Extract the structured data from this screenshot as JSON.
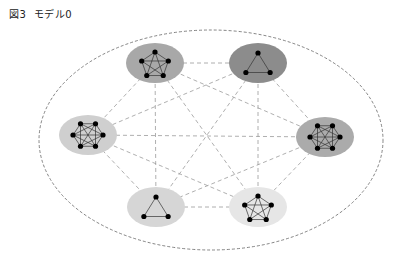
{
  "figure": {
    "title": "図3  モデル0"
  },
  "diagram": {
    "outer_boundary": {
      "cx": 211,
      "cy": 140,
      "rx": 172,
      "ry": 110,
      "style": "dashed"
    },
    "clusters": [
      {
        "id": "top-left",
        "shape": "pentagon",
        "nodes": 5,
        "cx": 155,
        "cy": 63,
        "fill": "#a8a8a8"
      },
      {
        "id": "top-right",
        "shape": "triangle",
        "nodes": 3,
        "cx": 258,
        "cy": 63,
        "fill": "#8c8c8c"
      },
      {
        "id": "left",
        "shape": "hexagon",
        "nodes": 6,
        "cx": 88,
        "cy": 135,
        "fill": "#cfcfcf"
      },
      {
        "id": "right",
        "shape": "hexagon",
        "nodes": 6,
        "cx": 325,
        "cy": 137,
        "fill": "#ababab"
      },
      {
        "id": "bottom-left",
        "shape": "triangle",
        "nodes": 3,
        "cx": 156,
        "cy": 207,
        "fill": "#d6d6d6"
      },
      {
        "id": "bottom-right",
        "shape": "pentagon",
        "nodes": 5,
        "cx": 258,
        "cy": 207,
        "fill": "#e6e6e6"
      }
    ],
    "inter_cluster_links": "all pairs, dashed",
    "intra_cluster_links": "complete graph, solid"
  }
}
